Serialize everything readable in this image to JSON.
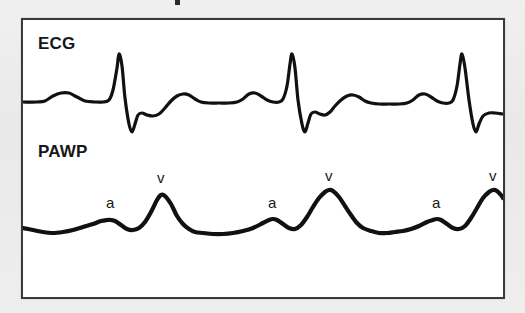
{
  "figure": {
    "background_color": "#ececed",
    "panel_color": "#ffffff",
    "border_color": "#3a3a3c",
    "trace_color": "#111111",
    "lanes": [
      {
        "id": "ecg",
        "label": "ECG"
      },
      {
        "id": "pawp",
        "label": "PAWP"
      }
    ],
    "wave_labels": [
      {
        "text": "a",
        "x": 83,
        "y": 175
      },
      {
        "text": "v",
        "x": 134,
        "y": 150
      },
      {
        "text": "a",
        "x": 245,
        "y": 175
      },
      {
        "text": "v",
        "x": 302,
        "y": 148
      },
      {
        "text": "a",
        "x": 409,
        "y": 175
      },
      {
        "text": "v",
        "x": 466,
        "y": 148
      }
    ]
  },
  "chart_data": {
    "type": "line",
    "xlabel": "",
    "ylabel": "",
    "grid": false,
    "legend_position": "none",
    "axis_note": "Screen coordinates inside panel: x right, y down. No numeric axes are printed on the figure.",
    "series": [
      {
        "name": "ECG",
        "annotation": "Three sinus beats: P wave, sharp QRS complex with deep S, then T wave.",
        "baseline_y": 82,
        "beats": [
          {
            "p_x": 48,
            "r_x": 96,
            "r_y": 34,
            "s_y": 110,
            "t_x": 150
          },
          {
            "p_x": 218,
            "r_x": 268,
            "r_y": 34,
            "s_y": 110,
            "t_x": 322
          },
          {
            "p_x": 388,
            "r_x": 438,
            "r_y": 34,
            "s_y": 110,
            "t_x": 480
          }
        ],
        "points": [
          [
            0,
            82
          ],
          [
            14,
            82
          ],
          [
            22,
            81
          ],
          [
            30,
            76
          ],
          [
            38,
            73
          ],
          [
            46,
            73
          ],
          [
            54,
            77
          ],
          [
            62,
            81
          ],
          [
            72,
            82
          ],
          [
            80,
            82
          ],
          [
            86,
            80
          ],
          [
            90,
            70
          ],
          [
            94,
            48
          ],
          [
            96,
            34
          ],
          [
            99,
            46
          ],
          [
            102,
            78
          ],
          [
            106,
            104
          ],
          [
            109,
            112
          ],
          [
            112,
            104
          ],
          [
            115,
            95
          ],
          [
            119,
            93
          ],
          [
            124,
            95
          ],
          [
            130,
            96
          ],
          [
            136,
            94
          ],
          [
            142,
            88
          ],
          [
            148,
            81
          ],
          [
            154,
            76
          ],
          [
            160,
            74
          ],
          [
            166,
            75
          ],
          [
            172,
            79
          ],
          [
            178,
            82
          ],
          [
            186,
            83
          ],
          [
            196,
            83
          ],
          [
            206,
            83
          ],
          [
            214,
            82
          ],
          [
            220,
            79
          ],
          [
            226,
            74
          ],
          [
            232,
            73
          ],
          [
            238,
            76
          ],
          [
            244,
            80
          ],
          [
            250,
            82
          ],
          [
            256,
            82
          ],
          [
            260,
            79
          ],
          [
            264,
            66
          ],
          [
            267,
            44
          ],
          [
            269,
            34
          ],
          [
            272,
            48
          ],
          [
            275,
            80
          ],
          [
            279,
            104
          ],
          [
            282,
            112
          ],
          [
            285,
            103
          ],
          [
            288,
            94
          ],
          [
            292,
            92
          ],
          [
            297,
            94
          ],
          [
            302,
            95
          ],
          [
            307,
            92
          ],
          [
            312,
            86
          ],
          [
            318,
            80
          ],
          [
            324,
            76
          ],
          [
            330,
            75
          ],
          [
            336,
            77
          ],
          [
            342,
            81
          ],
          [
            348,
            83
          ],
          [
            356,
            84
          ],
          [
            366,
            84
          ],
          [
            376,
            84
          ],
          [
            384,
            83
          ],
          [
            390,
            80
          ],
          [
            396,
            75
          ],
          [
            402,
            74
          ],
          [
            408,
            77
          ],
          [
            414,
            81
          ],
          [
            420,
            83
          ],
          [
            426,
            83
          ],
          [
            430,
            80
          ],
          [
            434,
            66
          ],
          [
            437,
            44
          ],
          [
            439,
            34
          ],
          [
            442,
            48
          ],
          [
            446,
            80
          ],
          [
            450,
            104
          ],
          [
            453,
            112
          ],
          [
            456,
            104
          ],
          [
            460,
            96
          ],
          [
            466,
            93
          ],
          [
            472,
            93
          ],
          [
            480,
            94
          ]
        ]
      },
      {
        "name": "PAWP",
        "annotation": "Three cycles, each with a small a wave followed by a prominent large v wave.",
        "a_wave_label": "a",
        "v_wave_label": "v",
        "cycles": [
          {
            "a_peak_x": 88,
            "a_peak_y": 200,
            "v_peak_x": 138,
            "v_peak_y": 174
          },
          {
            "a_peak_x": 250,
            "a_peak_y": 200,
            "v_peak_x": 306,
            "v_peak_y": 170
          },
          {
            "a_peak_x": 414,
            "a_peak_y": 200,
            "v_peak_x": 470,
            "v_peak_y": 170
          }
        ],
        "points": [
          [
            0,
            208
          ],
          [
            10,
            210
          ],
          [
            20,
            212
          ],
          [
            30,
            213
          ],
          [
            40,
            212
          ],
          [
            50,
            210
          ],
          [
            60,
            207
          ],
          [
            70,
            204
          ],
          [
            78,
            201
          ],
          [
            84,
            200
          ],
          [
            88,
            200
          ],
          [
            92,
            201
          ],
          [
            98,
            205
          ],
          [
            104,
            209
          ],
          [
            110,
            210
          ],
          [
            116,
            208
          ],
          [
            122,
            202
          ],
          [
            128,
            192
          ],
          [
            134,
            180
          ],
          [
            138,
            175
          ],
          [
            142,
            176
          ],
          [
            148,
            184
          ],
          [
            154,
            196
          ],
          [
            160,
            204
          ],
          [
            166,
            209
          ],
          [
            172,
            212
          ],
          [
            180,
            213
          ],
          [
            190,
            214
          ],
          [
            200,
            214
          ],
          [
            210,
            213
          ],
          [
            220,
            211
          ],
          [
            230,
            208
          ],
          [
            240,
            203
          ],
          [
            246,
            200
          ],
          [
            250,
            199
          ],
          [
            254,
            200
          ],
          [
            260,
            204
          ],
          [
            266,
            208
          ],
          [
            272,
            209
          ],
          [
            278,
            205
          ],
          [
            284,
            197
          ],
          [
            290,
            187
          ],
          [
            296,
            178
          ],
          [
            302,
            172
          ],
          [
            306,
            170
          ],
          [
            310,
            171
          ],
          [
            316,
            177
          ],
          [
            322,
            186
          ],
          [
            328,
            195
          ],
          [
            334,
            203
          ],
          [
            340,
            208
          ],
          [
            348,
            211
          ],
          [
            356,
            213
          ],
          [
            364,
            213
          ],
          [
            372,
            212
          ],
          [
            380,
            211
          ],
          [
            388,
            209
          ],
          [
            396,
            206
          ],
          [
            404,
            202
          ],
          [
            410,
            200
          ],
          [
            414,
            199
          ],
          [
            418,
            200
          ],
          [
            424,
            204
          ],
          [
            430,
            208
          ],
          [
            436,
            209
          ],
          [
            442,
            206
          ],
          [
            448,
            198
          ],
          [
            454,
            188
          ],
          [
            460,
            178
          ],
          [
            466,
            172
          ],
          [
            470,
            170
          ],
          [
            474,
            171
          ],
          [
            478,
            175
          ],
          [
            480,
            178
          ]
        ]
      }
    ]
  }
}
